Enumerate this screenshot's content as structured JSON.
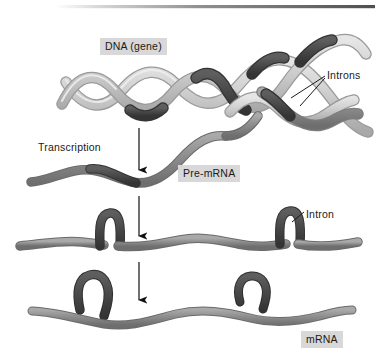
{
  "figure": {
    "labels": {
      "dna": "DNA (gene)",
      "transcription": "Transcription",
      "pre_mrna": "Pre-mRNA",
      "introns_plural": "Introns",
      "intron_singular": "Intron",
      "mrna": "mRNA"
    },
    "colors": {
      "strand_light": "#cdcdcd",
      "strand_light_edge": "#9a9a9a",
      "strand_mid": "#8f8f8f",
      "strand_mid_edge": "#6a6a6a",
      "intron_dark": "#4a4a4a",
      "intron_dark_edge": "#333333",
      "label_box": "#d8d8d8",
      "text": "#1a1a1a",
      "rule_dark": "#5c5c5c",
      "background": "#ffffff"
    },
    "stages": [
      {
        "name": "dna-gene",
        "label": "DNA (gene)",
        "description": "Double helix with dark intron segments"
      },
      {
        "name": "pre-mrna",
        "label": "Pre-mRNA",
        "description": "Single wavy strand with dark intron segments"
      },
      {
        "name": "intron-looping",
        "label": "Intron",
        "description": "Strand with introns looped out"
      },
      {
        "name": "mrna",
        "label": "mRNA",
        "description": "Spliced strand with introns excised"
      }
    ],
    "arrows": [
      {
        "name": "transcription-arrow",
        "from_y": 128,
        "to_y": 174
      },
      {
        "name": "splicing-arrow-1",
        "from_y": 196,
        "to_y": 240
      },
      {
        "name": "splicing-arrow-2",
        "from_y": 262,
        "to_y": 304
      }
    ]
  }
}
